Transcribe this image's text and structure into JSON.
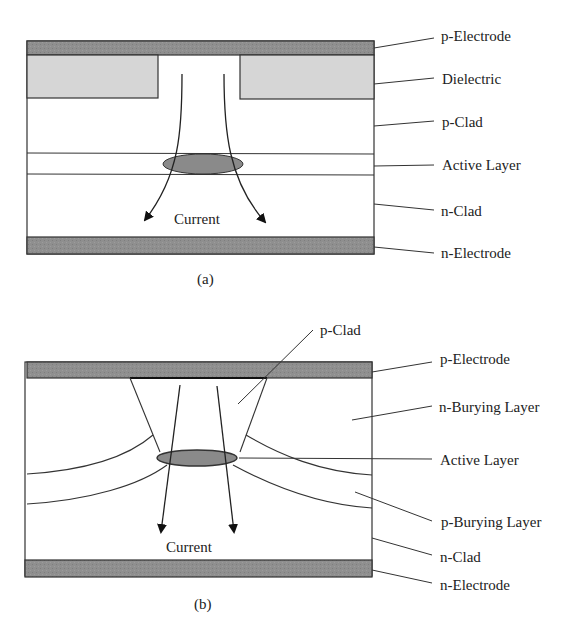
{
  "colors": {
    "electrode": "#8f8f8f",
    "dielectric": "#d6d6d6",
    "active_region": "#8a8a8a",
    "line": "#333333",
    "background": "#ffffff"
  },
  "diagram_a": {
    "caption": "(a)",
    "current_label": "Current",
    "labels": {
      "p_electrode": "p-Electrode",
      "dielectric": "Dielectric",
      "p_clad": "p-Clad",
      "active_layer": "Active Layer",
      "n_clad": "n-Clad",
      "n_electrode": "n-Electrode"
    }
  },
  "diagram_b": {
    "caption": "(b)",
    "current_label": "Current",
    "labels": {
      "p_clad": "p-Clad",
      "p_electrode": "p-Electrode",
      "n_burying_layer": "n-Burying Layer",
      "active_layer": "Active Layer",
      "p_burying_layer": "p-Burying Layer",
      "n_clad": "n-Clad",
      "n_electrode": "n-Electrode"
    }
  }
}
